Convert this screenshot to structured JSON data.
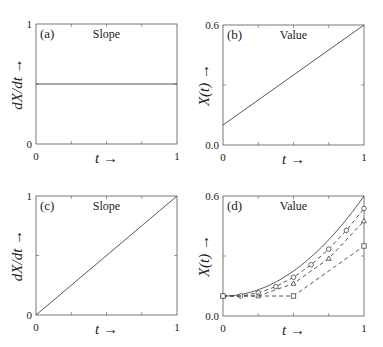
{
  "chart_data": [
    {
      "panel": "(a)",
      "title": "Slope",
      "type": "line",
      "xlabel": "t →",
      "ylabel": "dX/dt →",
      "xlim": [
        0,
        1
      ],
      "ylim": [
        0,
        1
      ],
      "xticks": [
        "0",
        "1"
      ],
      "yticks": [
        "0",
        "1"
      ],
      "series": [
        {
          "name": "slope",
          "x": [
            0,
            1
          ],
          "y": [
            0.5,
            0.5
          ],
          "style": "solid"
        }
      ]
    },
    {
      "panel": "(b)",
      "title": "Value",
      "type": "line",
      "xlabel": "t →",
      "ylabel": "X(t) →",
      "xlim": [
        0,
        1
      ],
      "ylim": [
        0,
        0.6
      ],
      "xticks": [
        "0",
        "1"
      ],
      "yticks": [
        "0.0",
        "0.6"
      ],
      "series": [
        {
          "name": "X(t)",
          "x": [
            0,
            1
          ],
          "y": [
            0.1,
            0.6
          ],
          "style": "solid"
        }
      ]
    },
    {
      "panel": "(c)",
      "title": "Slope",
      "type": "line",
      "xlabel": "t →",
      "ylabel": "dX/dt →",
      "xlim": [
        0,
        1
      ],
      "ylim": [
        0,
        1
      ],
      "xticks": [
        "0",
        "1"
      ],
      "yticks": [
        "0",
        "1"
      ],
      "series": [
        {
          "name": "slope",
          "x": [
            0,
            1
          ],
          "y": [
            0,
            1
          ],
          "style": "solid"
        }
      ]
    },
    {
      "panel": "(d)",
      "title": "Value",
      "type": "line",
      "xlabel": "t →",
      "ylabel": "X(t) →",
      "xlim": [
        0,
        1
      ],
      "ylim": [
        0,
        0.6
      ],
      "xticks": [
        "0",
        "1"
      ],
      "yticks": [
        "0.0",
        "0.6"
      ],
      "series": [
        {
          "name": "exact X(t)",
          "style": "solid",
          "marker": "none",
          "x": [
            0,
            0.1,
            0.2,
            0.3,
            0.4,
            0.5,
            0.6,
            0.7,
            0.8,
            0.9,
            1.0
          ],
          "y": [
            0.1,
            0.105,
            0.12,
            0.145,
            0.18,
            0.225,
            0.28,
            0.345,
            0.42,
            0.505,
            0.6
          ]
        },
        {
          "name": "h=1/8",
          "style": "dashed",
          "marker": "circle",
          "x": [
            0,
            0.125,
            0.25,
            0.375,
            0.5,
            0.625,
            0.75,
            0.875,
            1.0
          ],
          "y": [
            0.1,
            0.1,
            0.1078,
            0.1234,
            0.1469,
            0.1781,
            0.2172,
            0.2641,
            0.3188
          ]
        },
        {
          "name": "h=1/4",
          "style": "dashed",
          "marker": "triangle",
          "x": [
            0,
            0.25,
            0.5,
            0.75,
            1.0
          ],
          "y": [
            0.1,
            0.1,
            0.1625,
            0.2875,
            0.475
          ]
        },
        {
          "name": "h=1/2",
          "style": "dashed",
          "marker": "square",
          "x": [
            0,
            0.5,
            1.0
          ],
          "y": [
            0.1,
            0.1,
            0.35
          ]
        }
      ]
    }
  ]
}
